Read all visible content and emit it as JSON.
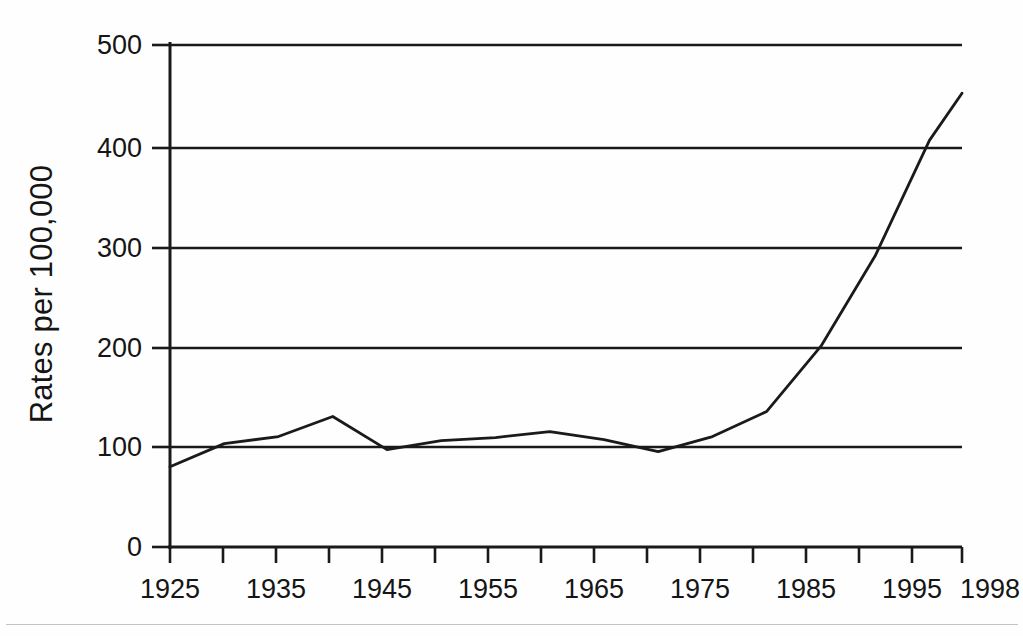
{
  "figure": {
    "background_color": "#fefefe",
    "line_color": "#1a1a1a",
    "grid_color": "#1a1a1a",
    "axis_color": "#1a1a1a"
  },
  "axis": {
    "y_title": "Rates per 100,000",
    "y_ticks": [
      "0",
      "100",
      "200",
      "300",
      "400",
      "500"
    ],
    "x_ticks": [
      "1925",
      "1935",
      "1945",
      "1955",
      "1965",
      "1975",
      "1985",
      "1995",
      "1998"
    ]
  },
  "chart_data": {
    "type": "line",
    "title": "",
    "subtitle": "",
    "xlabel": "",
    "ylabel": "Rates per 100,000",
    "xlim": [
      1925,
      1998
    ],
    "ylim": [
      0,
      500
    ],
    "grid": true,
    "grid_axis": "y",
    "legend": false,
    "legend_position": "none",
    "x_tick_values": [
      1925,
      1935,
      1945,
      1955,
      1965,
      1975,
      1985,
      1995,
      1998
    ],
    "x_minor_tick_values": [
      1925,
      1930,
      1935,
      1940,
      1945,
      1950,
      1955,
      1960,
      1965,
      1970,
      1975,
      1980,
      1985,
      1990,
      1995,
      1998
    ],
    "y_tick_values": [
      0,
      100,
      200,
      300,
      400,
      500
    ],
    "x": [
      1925,
      1930,
      1935,
      1940,
      1945,
      1950,
      1955,
      1960,
      1965,
      1970,
      1975,
      1980,
      1985,
      1990,
      1995,
      1998
    ],
    "values": [
      80,
      103,
      110,
      130,
      97,
      106,
      109,
      115,
      107,
      95,
      110,
      135,
      200,
      290,
      405,
      452
    ],
    "series": [
      {
        "name": "Rates per 100,000",
        "values": [
          80,
          103,
          110,
          130,
          97,
          106,
          109,
          115,
          107,
          95,
          110,
          135,
          200,
          290,
          405,
          452
        ]
      }
    ],
    "annotations": []
  }
}
